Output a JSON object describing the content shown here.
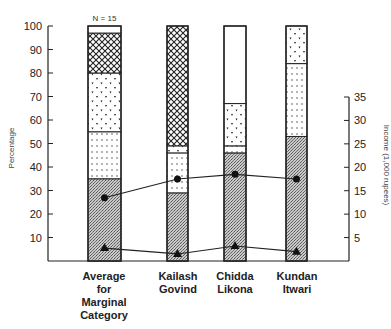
{
  "chart_data": {
    "type": "bar",
    "subtype": "stacked-bar-with-lines",
    "title": "",
    "annotation": "N = 15",
    "categories": [
      [
        "Average",
        "for",
        "Marginal",
        "Category"
      ],
      [
        "Kailash",
        "Govind"
      ],
      [
        "Chidda",
        "Likona"
      ],
      [
        "Kundan",
        "Itwari"
      ]
    ],
    "ylabel": "Percentage",
    "ylim": [
      0,
      100
    ],
    "yticks": [
      10,
      20,
      30,
      40,
      50,
      60,
      70,
      80,
      90,
      100
    ],
    "y2label": "Income (1,000 rupees)",
    "y2lim": [
      0,
      35
    ],
    "y2ticks": [
      5,
      10,
      15,
      20,
      25,
      30,
      35
    ],
    "stacked_series": [
      {
        "name": "gray-stipple",
        "pattern": "dense-gray",
        "values": [
          35,
          29,
          46,
          53
        ]
      },
      {
        "name": "dots",
        "pattern": "dots",
        "values": [
          20,
          17,
          3,
          31
        ]
      },
      {
        "name": "triangles",
        "pattern": "triangles",
        "values": [
          25,
          3,
          18,
          16
        ]
      },
      {
        "name": "crosshatch",
        "pattern": "crosshatch",
        "values": [
          17,
          51,
          0,
          0
        ]
      },
      {
        "name": "white",
        "pattern": "none",
        "values": [
          3,
          0,
          33,
          0
        ]
      }
    ],
    "line_series": [
      {
        "name": "circle-line",
        "marker": "circle",
        "axis": "right",
        "values": [
          13.5,
          17.5,
          18.5,
          17.5
        ]
      },
      {
        "name": "triangle-line",
        "marker": "triangle",
        "axis": "right",
        "values": [
          2.75,
          1.5,
          3.2,
          2.0
        ]
      }
    ],
    "grid": false,
    "legend": "none"
  }
}
